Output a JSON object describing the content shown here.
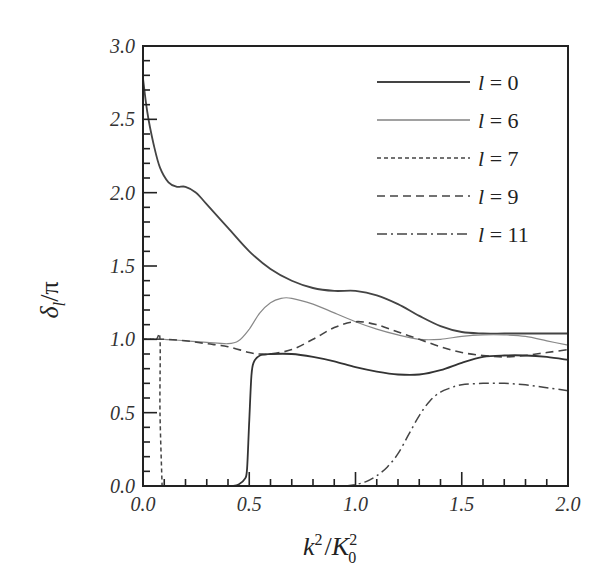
{
  "chart_data": {
    "type": "line",
    "title": "",
    "xlabel": "k^2/K_0^2",
    "ylabel": "δ_l/π",
    "xlim": [
      0.0,
      2.0
    ],
    "ylim": [
      0.0,
      3.0
    ],
    "grid": false,
    "legend_position": "upper right",
    "x_ticks": [
      "0.0",
      "0.5",
      "1.0",
      "1.5",
      "2.0"
    ],
    "y_ticks": [
      "0.0",
      "0.5",
      "1.0",
      "1.5",
      "2.0",
      "2.5",
      "3.0"
    ],
    "series": [
      {
        "name": "l = 0",
        "style": "solid",
        "color": "#444444",
        "x": [
          0.0,
          0.02,
          0.05,
          0.08,
          0.12,
          0.16,
          0.2,
          0.25,
          0.3,
          0.4,
          0.5,
          0.6,
          0.7,
          0.8,
          0.9,
          1.0,
          1.1,
          1.2,
          1.3,
          1.4,
          1.5,
          1.6,
          1.7,
          1.8,
          1.9,
          2.0
        ],
        "y": [
          2.78,
          2.55,
          2.33,
          2.17,
          2.07,
          2.04,
          2.04,
          2.0,
          1.92,
          1.76,
          1.6,
          1.48,
          1.4,
          1.35,
          1.33,
          1.33,
          1.3,
          1.24,
          1.16,
          1.09,
          1.05,
          1.04,
          1.04,
          1.04,
          1.04,
          1.04
        ]
      },
      {
        "name": "l = 6",
        "style": "solid-thin",
        "color": "#888888",
        "x": [
          0.0,
          0.1,
          0.2,
          0.3,
          0.4,
          0.45,
          0.5,
          0.55,
          0.6,
          0.65,
          0.7,
          0.8,
          0.9,
          1.0,
          1.1,
          1.2,
          1.3,
          1.4,
          1.5,
          1.6,
          1.7,
          1.8,
          1.9,
          2.0
        ],
        "y": [
          1.0,
          1.0,
          0.99,
          0.98,
          0.97,
          0.99,
          1.07,
          1.18,
          1.25,
          1.28,
          1.28,
          1.24,
          1.18,
          1.12,
          1.07,
          1.03,
          1.0,
          1.0,
          1.02,
          1.03,
          1.03,
          1.02,
          0.99,
          0.96
        ]
      },
      {
        "name": "l = 7",
        "style": "dotted",
        "color": "#444444",
        "x": [
          0.0,
          0.06,
          0.08,
          0.08,
          0.09
        ],
        "y": [
          1.0,
          1.0,
          1.0,
          0.5,
          0.0
        ]
      },
      {
        "name": "l = 9",
        "style": "dashed",
        "color": "#444444",
        "x": [
          0.0,
          0.1,
          0.2,
          0.3,
          0.4,
          0.5,
          0.55,
          0.6,
          0.7,
          0.8,
          0.9,
          1.0,
          1.1,
          1.2,
          1.3,
          1.4,
          1.5,
          1.6,
          1.7,
          1.8,
          1.9,
          2.0
        ],
        "y": [
          1.0,
          1.0,
          0.99,
          0.97,
          0.95,
          0.91,
          0.9,
          0.9,
          0.93,
          1.0,
          1.08,
          1.12,
          1.1,
          1.05,
          1.0,
          0.95,
          0.91,
          0.89,
          0.88,
          0.89,
          0.91,
          0.93
        ]
      },
      {
        "name": "l = 11",
        "style": "dash-dot",
        "color": "#444444",
        "x": [
          0.95,
          1.0,
          1.05,
          1.1,
          1.15,
          1.2,
          1.25,
          1.3,
          1.35,
          1.4,
          1.45,
          1.5,
          1.6,
          1.7,
          1.8,
          1.9,
          2.0
        ],
        "y": [
          0.0,
          0.01,
          0.03,
          0.07,
          0.13,
          0.22,
          0.35,
          0.48,
          0.58,
          0.64,
          0.67,
          0.69,
          0.7,
          0.7,
          0.69,
          0.67,
          0.65
        ]
      },
      {
        "name": "l = 0 (lower branch)",
        "style": "solid",
        "color": "#333333",
        "x": [
          0.42,
          0.45,
          0.48,
          0.49,
          0.5,
          0.51,
          0.52,
          0.55,
          0.6,
          0.7,
          0.8,
          0.9,
          1.0,
          1.1,
          1.2,
          1.3,
          1.4,
          1.5,
          1.6,
          1.7,
          1.8,
          1.9,
          2.0
        ],
        "y": [
          0.0,
          0.01,
          0.05,
          0.12,
          0.45,
          0.75,
          0.84,
          0.89,
          0.9,
          0.9,
          0.88,
          0.85,
          0.81,
          0.78,
          0.76,
          0.76,
          0.79,
          0.84,
          0.88,
          0.89,
          0.89,
          0.88,
          0.86
        ]
      }
    ],
    "legend": [
      {
        "label": "l = 0",
        "style": "solid"
      },
      {
        "label": "l = 6",
        "style": "solid-thin"
      },
      {
        "label": "l = 7",
        "style": "dotted"
      },
      {
        "label": "l = 9",
        "style": "dashed"
      },
      {
        "label": "l = 11",
        "style": "dash-dot"
      }
    ]
  },
  "labels": {
    "xlabel_main": "k",
    "xlabel_sup1": "2",
    "xlabel_slash": "/",
    "xlabel_K": "K",
    "xlabel_sub": "0",
    "xlabel_sup2": "2",
    "ylabel_delta": "δ",
    "ylabel_sub": "l",
    "ylabel_rest": "/π"
  }
}
